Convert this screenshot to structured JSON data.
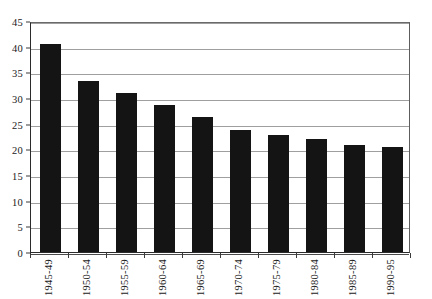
{
  "chart_data": {
    "type": "bar",
    "title": "",
    "subtitle": "",
    "xlabel": "",
    "ylabel": "",
    "categories": [
      "1945-49",
      "1950-54",
      "1955-59",
      "1960-64",
      "1965-69",
      "1970-74",
      "1975-79",
      "1980-84",
      "1985-89",
      "1990-95"
    ],
    "values": [
      40.5,
      33.3,
      31.0,
      28.7,
      26.3,
      23.7,
      22.8,
      22.0,
      20.9,
      20.4
    ],
    "ylim": [
      0,
      45
    ],
    "ytick_step": 5,
    "ytick_labels": [
      "0",
      "5",
      "10",
      "15",
      "20",
      "25",
      "30",
      "35",
      "40",
      "45"
    ],
    "ytick_values": [
      0,
      5,
      10,
      15,
      20,
      25,
      30,
      35,
      40,
      45
    ],
    "grid": true,
    "grid_axis": "y",
    "legend": false,
    "legend_position": "none",
    "xtick_label_rotation": 90,
    "bar_color": "#141414",
    "grid_color": "#8e8e8e",
    "axis_color": "#2b2b2b",
    "background_color": "#ffffff",
    "annotations": []
  }
}
